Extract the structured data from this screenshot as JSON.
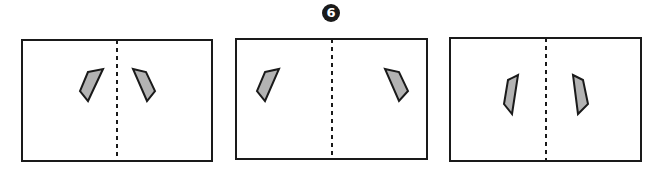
{
  "figure": {
    "step_marker": "6",
    "colors": {
      "frame": "#1a1a1a",
      "fill": "#b3b3b3",
      "background": "#ffffff"
    },
    "panels": [
      {
        "frame": {
          "x": 22,
          "y": 40,
          "w": 190,
          "h": 121
        },
        "fold_line_x": 117,
        "shapes": [
          "88,72 103,69 88,101 80,91",
          "133,69 146,72 155,91 147,101"
        ]
      },
      {
        "frame": {
          "x": 236,
          "y": 39,
          "w": 191,
          "h": 120
        },
        "fold_line_x": 332,
        "shapes": [
          "265,72 279,69 265,101 257,91",
          "385,69 399,72 408,91 399,101"
        ]
      },
      {
        "frame": {
          "x": 450,
          "y": 38,
          "w": 191,
          "h": 123
        },
        "fold_line_x": 546,
        "shapes": [
          "508,80 518,75 512,114 504,104",
          "573,75 583,80 588,104 578,114"
        ]
      }
    ]
  }
}
